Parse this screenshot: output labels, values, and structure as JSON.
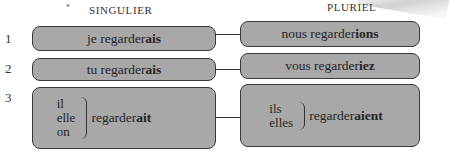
{
  "headers": {
    "asterisk": "*",
    "singular": "SINGULIER",
    "plural": "PLURIEL"
  },
  "rows": [
    {
      "number": "1",
      "singular": {
        "stem": "je regarder",
        "ending": "ais"
      },
      "plural": {
        "stem": "nous regarder",
        "ending": "ions"
      }
    },
    {
      "number": "2",
      "singular": {
        "stem": "tu regarder",
        "ending": "ais"
      },
      "plural": {
        "stem": "vous regarder",
        "ending": "iez"
      }
    },
    {
      "number": "3",
      "singular": {
        "pronouns": [
          "il",
          "elle",
          "on"
        ],
        "stem": "regarder",
        "ending": "ait"
      },
      "plural": {
        "pronouns": [
          "ils",
          "elles"
        ],
        "stem": "regarder",
        "ending": "aient"
      }
    }
  ],
  "colors": {
    "box_fill": "#a8a8a8",
    "box_border": "#3a3a3a",
    "text": "#262626",
    "background": "#ffffff"
  }
}
